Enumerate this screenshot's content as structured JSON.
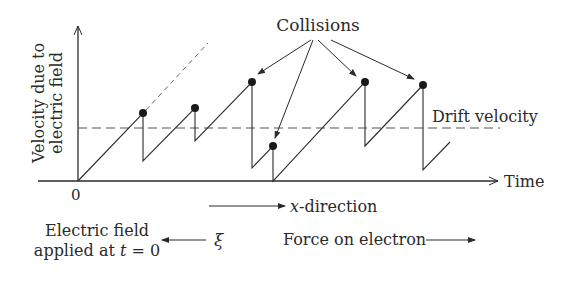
{
  "diagram": {
    "y_axis_label_line1": "Velocity due to",
    "y_axis_label_line2": "electric field",
    "x_axis_label": "Time",
    "origin_label": "0",
    "collisions_label": "Collisions",
    "drift_velocity_label": "Drift velocity",
    "x_direction_label": "x-direction",
    "electric_field_label_line1": "Electric field",
    "electric_field_label_line2": "applied at t = 0",
    "field_symbol": "ξ",
    "force_label": "Force on electron"
  },
  "colors": {
    "ink": "#2a2a2a",
    "dashed": "#555555",
    "background": "#ffffff"
  }
}
